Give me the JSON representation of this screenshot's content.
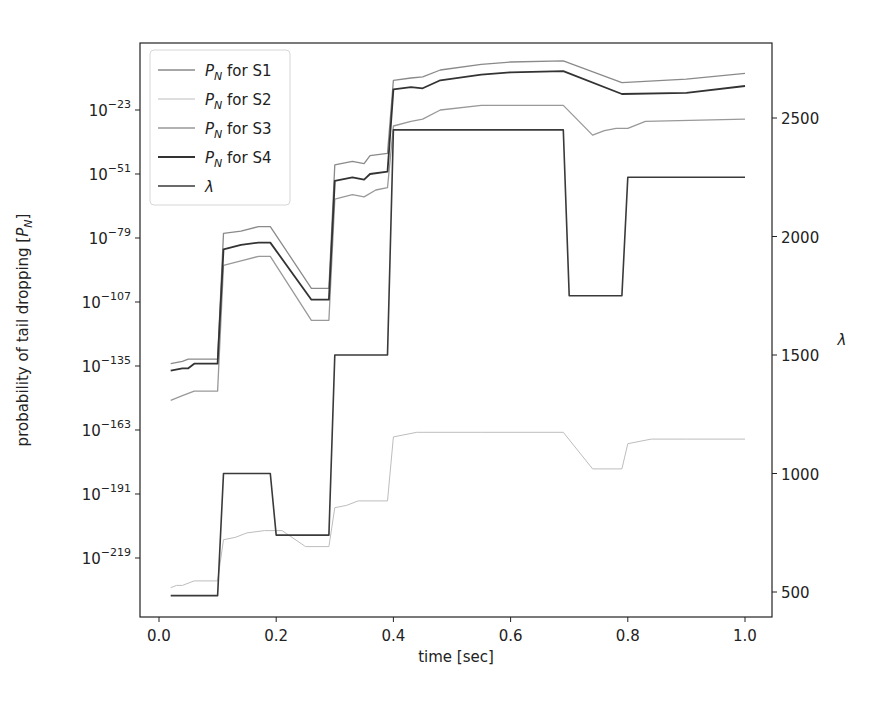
{
  "chart_data": {
    "type": "line",
    "title": "",
    "xlabel": "time [sec]",
    "ylabel": "probability of tail dropping [P_N]",
    "ylabel_right": "λ",
    "xlim": [
      -0.033,
      1.047
    ],
    "x_ticks": [
      0.0,
      0.2,
      0.4,
      0.6,
      0.8,
      1.0
    ],
    "x_tick_labels": [
      "0.0",
      "0.2",
      "0.4",
      "0.6",
      "0.8",
      "1.0"
    ],
    "y_left_scale": "log10",
    "y_left_tick_exponents": [
      -23,
      -51,
      -79,
      -107,
      -135,
      -163,
      -191,
      -219
    ],
    "y_left_tick_labels": [
      "10^-23",
      "10^-51",
      "10^-79",
      "10^-107",
      "10^-135",
      "10^-163",
      "10^-191",
      "10^-219"
    ],
    "y_right_ticks": [
      500,
      1000,
      1500,
      2000,
      2500
    ],
    "y_right_tick_labels": [
      "500",
      "1000",
      "1500",
      "2000",
      "2500"
    ],
    "grid": false,
    "legend_position": "upper left",
    "legend": [
      "P_N for S1",
      "P_N for S2",
      "P_N for S3",
      "P_N for S4",
      "λ"
    ],
    "series": [
      {
        "name": "P_N for S1",
        "axis": "left",
        "color": "#8a8a8a",
        "width": 1.3,
        "x": [
          0.02,
          0.04,
          0.05,
          0.06,
          0.1,
          0.11,
          0.14,
          0.17,
          0.19,
          0.26,
          0.29,
          0.3,
          0.33,
          0.35,
          0.36,
          0.39,
          0.4,
          0.43,
          0.45,
          0.48,
          0.55,
          0.6,
          0.69,
          0.79,
          0.9,
          1.0
        ],
        "log10_y": [
          -134,
          -133,
          -132,
          -132,
          -132,
          -77,
          -76,
          -74,
          -74,
          -101,
          -101,
          -47,
          -45.5,
          -46.5,
          -43,
          -42,
          -10,
          -9,
          -8.5,
          -5.5,
          -3,
          -2,
          -1.5,
          -11,
          -9.5,
          -7
        ]
      },
      {
        "name": "P_N for S2",
        "axis": "left",
        "color": "#bdbdbd",
        "width": 1.0,
        "x": [
          0.02,
          0.03,
          0.04,
          0.06,
          0.1,
          0.11,
          0.13,
          0.15,
          0.18,
          0.21,
          0.25,
          0.29,
          0.3,
          0.32,
          0.34,
          0.39,
          0.4,
          0.44,
          0.55,
          0.69,
          0.74,
          0.79,
          0.8,
          0.84,
          0.9,
          1.0
        ],
        "log10_y": [
          -232,
          -231,
          -231,
          -229,
          -229,
          -211,
          -210,
          -208,
          -207,
          -207,
          -214,
          -214,
          -197,
          -196,
          -194,
          -194,
          -166,
          -164,
          -164,
          -164,
          -180,
          -180,
          -169,
          -167,
          -167,
          -167
        ]
      },
      {
        "name": "P_N for S3",
        "axis": "left",
        "color": "#999999",
        "width": 1.3,
        "x": [
          0.02,
          0.04,
          0.06,
          0.1,
          0.11,
          0.14,
          0.17,
          0.19,
          0.26,
          0.29,
          0.3,
          0.33,
          0.35,
          0.37,
          0.39,
          0.4,
          0.43,
          0.45,
          0.48,
          0.55,
          0.6,
          0.69,
          0.74,
          0.76,
          0.78,
          0.8,
          0.83,
          1.0
        ],
        "log10_y": [
          -150,
          -148,
          -146,
          -146,
          -91,
          -89,
          -87,
          -87,
          -115,
          -115,
          -62,
          -60,
          -61,
          -58,
          -57,
          -30,
          -28,
          -27,
          -23,
          -21,
          -21,
          -21,
          -34,
          -32,
          -31,
          -31,
          -28,
          -27
        ]
      },
      {
        "name": "P_N for S4",
        "axis": "left",
        "color": "#333333",
        "width": 1.8,
        "x": [
          0.02,
          0.04,
          0.05,
          0.06,
          0.1,
          0.11,
          0.14,
          0.17,
          0.19,
          0.26,
          0.29,
          0.3,
          0.33,
          0.35,
          0.36,
          0.39,
          0.4,
          0.43,
          0.45,
          0.48,
          0.55,
          0.6,
          0.69,
          0.79,
          0.9,
          1.0
        ],
        "log10_y": [
          -137,
          -136,
          -136,
          -134,
          -134,
          -84,
          -82,
          -81,
          -81,
          -106,
          -106,
          -54,
          -52.5,
          -53.5,
          -51,
          -50,
          -14,
          -13,
          -13.5,
          -10,
          -7.5,
          -6.5,
          -6,
          -16,
          -15.5,
          -12.5
        ]
      },
      {
        "name": "λ",
        "axis": "right",
        "color": "#3a3a3a",
        "width": 1.6,
        "x": [
          0.02,
          0.1,
          0.11,
          0.19,
          0.2,
          0.29,
          0.3,
          0.39,
          0.4,
          0.69,
          0.7,
          0.79,
          0.8,
          1.0
        ],
        "y": [
          485,
          485,
          1000,
          1000,
          740,
          740,
          1500,
          1500,
          2450,
          2450,
          1750,
          1750,
          2250,
          2250
        ]
      }
    ]
  },
  "layout": {
    "frame": {
      "left": 140,
      "top": 43,
      "right": 772,
      "bottom": 617
    },
    "x_px_at_0": 159,
    "x_px_per_unit": 586,
    "left_y_px_at_exp_minus23": 110,
    "left_y_px_per_decade": 2.2857,
    "right_y_px_at_500": 592,
    "right_y_px_per_unit": 0.237
  }
}
